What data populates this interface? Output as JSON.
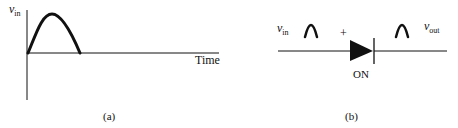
{
  "panel_a": {
    "y_axis_label_var": "v",
    "y_axis_label_sub": "in",
    "x_axis_label": "Time",
    "caption": "(a)",
    "waveform": "half-sine pulse"
  },
  "panel_b": {
    "input_label_var": "v",
    "input_label_sub": "in",
    "output_label_var": "v",
    "output_label_sub": "out",
    "polarity_mark": "+",
    "diode_state": "ON",
    "caption": "(b)",
    "component": "diode",
    "input_waveform_icon": "half-sine-pulse-icon",
    "output_waveform_icon": "half-sine-pulse-icon"
  },
  "colors": {
    "stroke": "#111111",
    "background": "#ffffff"
  }
}
